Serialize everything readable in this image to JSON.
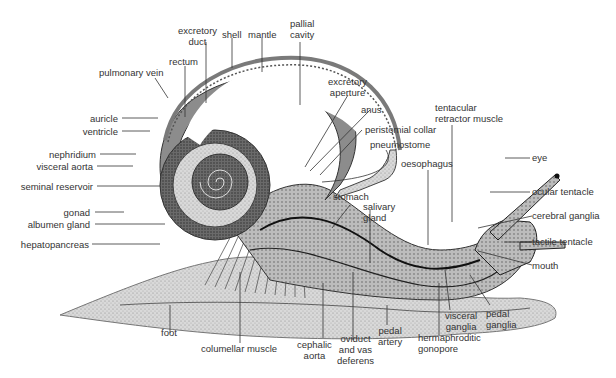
{
  "diagram": {
    "colors": {
      "text": "#333333",
      "line": "#222222",
      "shell": "#9a9a9a",
      "foot": "#bdbdbd",
      "organ_dark": "#555555"
    },
    "labels": {
      "excretory_duct_1": "excretory",
      "excretory_duct_2": "duct",
      "shell": "shell",
      "mantle": "mantle",
      "pallial_cavity_1": "pallial",
      "pallial_cavity_2": "cavity",
      "rectum": "rectum",
      "pulmonary_vein": "pulmonary vein",
      "auricle": "auricle",
      "ventricle": "ventricle",
      "nephridium": "nephridium",
      "visceral_aorta": "visceral aorta",
      "seminal_reservoir": "seminal reservoir",
      "gonad": "gonad",
      "albumen_gland": "albumen gland",
      "hepatopancreas": "hepatopancreas",
      "excretory_aperture_1": "excretory",
      "excretory_aperture_2": "aperture",
      "anus": "anus",
      "peristomial_collar": "peristomial collar",
      "pneumostome": "pneumostome",
      "tentacular_retractor_1": "tentacular",
      "tentacular_retractor_2": "retractor muscle",
      "oesophagus": "oesophagus",
      "eye": "eye",
      "ocular_tentacle": "ocular tentacle",
      "cerebral_ganglia": "cerebral ganglia",
      "tactile_tentacle": "tactile tentacle",
      "mouth": "mouth",
      "stomach": "stomach",
      "salivary_gland_1": "salivary",
      "salivary_gland_2": "gland",
      "foot": "foot",
      "columellar_muscle": "columellar muscle",
      "cephalic_aorta_1": "cephalic",
      "cephalic_aorta_2": "aorta",
      "oviduct_1": "oviduct",
      "oviduct_2": "and vas",
      "oviduct_3": "deferens",
      "pedal_artery_1": "pedal",
      "pedal_artery_2": "artery",
      "hermaphroditic_gonopore_1": "hermaphroditic",
      "hermaphroditic_gonopore_2": "gonopore",
      "visceral_ganglia_1": "visceral",
      "visceral_ganglia_2": "ganglia",
      "pedal_ganglia_1": "pedal",
      "pedal_ganglia_2": "ganglia"
    }
  }
}
